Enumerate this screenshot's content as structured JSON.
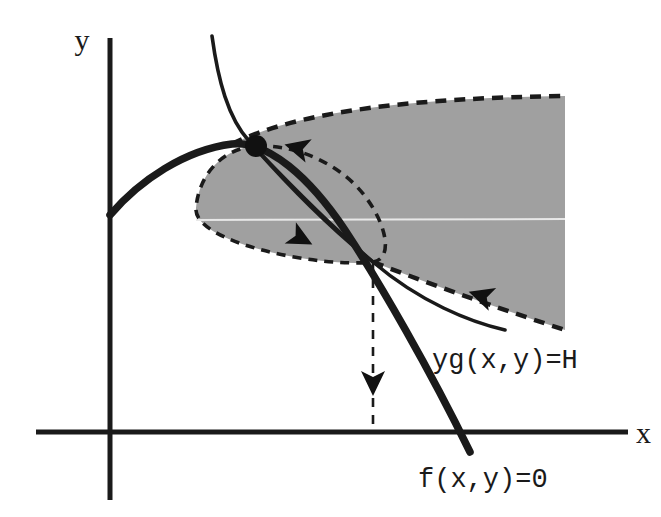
{
  "figure": {
    "kind": "phase-plane-diagram",
    "background_color": "#ffffff",
    "ink_color": "#1a1a1a",
    "shade_color": "#a0a0a0",
    "width": 661,
    "height": 517
  },
  "axes": {
    "x_label": "x",
    "y_label": "y",
    "origin": {
      "x": 110,
      "y": 432
    },
    "x_axis": {
      "x1": 36,
      "y1": 432,
      "x2": 628,
      "y2": 432
    },
    "y_axis": {
      "x1": 110,
      "y1": 38,
      "x2": 110,
      "y2": 500
    },
    "x_label_pos": {
      "x": 636,
      "y": 443
    },
    "y_label_pos": {
      "x": 82,
      "y": 50
    }
  },
  "labels": {
    "nullcline_f": "f(x,y)=0",
    "level_set_h": "yg(x,y)=H",
    "nullcline_f_pos": {
      "x": 418,
      "y": 487
    },
    "level_set_h_pos": {
      "x": 432,
      "y": 368
    }
  },
  "equilibrium_point": {
    "name": "equilibrium-dot",
    "x": 256,
    "y": 146,
    "radius": 11
  },
  "saddle_junction": {
    "name": "trajectory-junction",
    "x": 373,
    "y": 262
  },
  "chart_data": {
    "type": "line",
    "title": "",
    "xlabel": "x",
    "ylabel": "y",
    "grid": false,
    "legend": null,
    "annotations": [
      {
        "text": "f(x,y)=0",
        "x": 418,
        "y": 487
      },
      {
        "text": "yg(x,y)=H",
        "x": 432,
        "y": 368
      }
    ],
    "series": [
      {
        "name": "f-nullcline-thick-curve",
        "style": "solid-thick",
        "path": "M 110 215 C 140 180, 185 150, 232 144 C 268 140, 310 178, 345 230 C 380 283, 430 370, 470 452"
      },
      {
        "name": "level-set-thin-curve-upper",
        "style": "solid-thin",
        "path": "M 212 36 C 218 80, 228 118, 249 141 C 285 182, 330 228, 373 262"
      },
      {
        "name": "level-set-thin-curve-lower",
        "style": "solid-thin",
        "path": "M 259 152 C 300 195, 345 238, 373 262 C 420 302, 470 322, 505 330"
      },
      {
        "name": "homoclinic-loop-dashed",
        "style": "dashed",
        "path": "M 256 146 C 224 148, 199 173, 196 208 C 193 243, 320 268, 373 262 C 400 258, 380 200, 340 172 C 312 152, 282 145, 256 146 Z"
      },
      {
        "name": "shaded-region-upper-dashed-boundary",
        "style": "dashed",
        "path": "M 232 144 C 300 110, 420 98, 565 96"
      },
      {
        "name": "shaded-region-lower-dashed-boundary",
        "style": "dashed",
        "path": "M 373 262 C 440 288, 510 312, 565 330"
      },
      {
        "name": "vertical-dashed-drop-line",
        "style": "dashed",
        "path": "M 373 262 L 373 432"
      }
    ],
    "shaded_region": {
      "name": "invariant-region",
      "fill": "#a0a0a0",
      "path": "M 232 144 C 300 110, 420 98, 565 96 L 565 330 C 510 312, 440 288, 373 262 C 320 268, 193 243, 196 208 C 199 173, 224 148, 256 146 C 244 144, 237 144, 232 144 Z"
    },
    "flow_arrows": [
      {
        "name": "arrow-toward-equilibrium",
        "x": 298,
        "y": 148,
        "angle": 195
      },
      {
        "name": "arrow-along-lower-loop",
        "x": 300,
        "y": 238,
        "angle": 28
      },
      {
        "name": "arrow-inflow-lower-boundary",
        "x": 482,
        "y": 296,
        "angle": 198
      },
      {
        "name": "arrow-down-dashed-drop",
        "x": 373,
        "y": 382,
        "angle": 90
      }
    ]
  }
}
